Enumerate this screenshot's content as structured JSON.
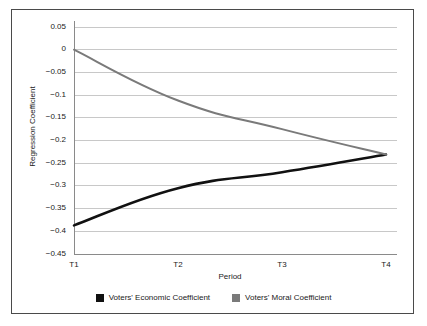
{
  "chart_data": {
    "type": "line",
    "title": "",
    "xlabel": "Period",
    "ylabel": "Regression Coefficient",
    "categories": [
      "T1",
      "T2",
      "T3",
      "T4"
    ],
    "ylim": [
      -0.45,
      0.05
    ],
    "yticks": [
      0.05,
      0,
      -0.05,
      -0.1,
      -0.15,
      -0.2,
      -0.25,
      -0.3,
      -0.35,
      -0.4,
      -0.45
    ],
    "ytick_labels": [
      "0.05",
      "0",
      "−0.05",
      "−0.1",
      "−0.15",
      "−0.2",
      "−0.25",
      "−0.3",
      "−0.35",
      "−0.4",
      "−0.45"
    ],
    "grid": true,
    "legend_position": "bottom",
    "series": [
      {
        "name": "Voters' Economic Coefficient",
        "color": "#111111",
        "values": [
          -0.387,
          -0.305,
          -0.27,
          -0.231
        ]
      },
      {
        "name": "Voters' Moral Coefficient",
        "color": "#7a7a7a",
        "values": [
          0.0,
          -0.112,
          -0.175,
          -0.231
        ]
      }
    ]
  },
  "legend": {
    "entries": [
      {
        "label": "Voters' Economic Coefficient",
        "color": "#111111"
      },
      {
        "label": "Voters' Moral Coefficient",
        "color": "#7a7a7a"
      }
    ]
  },
  "colors": {
    "economic": "#111111",
    "moral": "#7a7a7a",
    "grid": "#c8c8c8",
    "axis": "#8a8a8a",
    "frame": "#4a4a4a",
    "background": "#ffffff"
  }
}
